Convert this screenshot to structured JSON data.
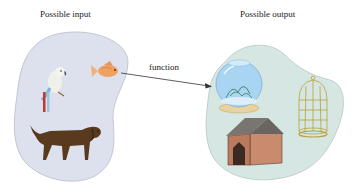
{
  "input_set": {
    "title": "Possible input",
    "items": [
      "parrot",
      "goldfish",
      "dog"
    ],
    "fill_color": "#dde1ee"
  },
  "output_set": {
    "title": "Possible output",
    "items": [
      "fishbowl",
      "birdcage",
      "doghouse"
    ],
    "fill_color": "#d6e6e2"
  },
  "arrow": {
    "label": "function",
    "from": "goldfish",
    "to": "fishbowl"
  }
}
